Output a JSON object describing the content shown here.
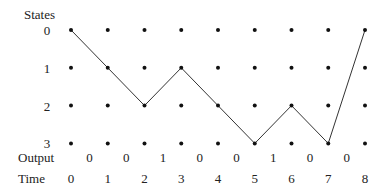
{
  "diagram": {
    "states_label": "States",
    "output_label": "Output",
    "time_label": "Time",
    "states": [
      "0",
      "1",
      "2",
      "3"
    ],
    "times": [
      "0",
      "1",
      "2",
      "3",
      "4",
      "5",
      "6",
      "7",
      "8"
    ],
    "outputs": [
      "0",
      "0",
      "1",
      "0",
      "0",
      "1",
      "0",
      "0"
    ],
    "path_states": [
      0,
      1,
      2,
      1,
      2,
      3,
      2,
      3,
      0
    ],
    "colors": {
      "dot": "#111111",
      "line": "#333333",
      "text": "#222222"
    }
  }
}
